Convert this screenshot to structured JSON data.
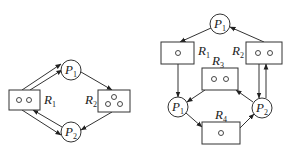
{
  "diagrams": [
    {
      "id": "left",
      "processes": [
        {
          "name": "P",
          "sub": "1",
          "cx": 71,
          "cy": 70
        },
        {
          "name": "P",
          "sub": "2",
          "cx": 71,
          "cy": 132
        }
      ],
      "resources": [
        {
          "name": "R",
          "sub": "1",
          "instances": 2,
          "label_pos": "right"
        },
        {
          "name": "R",
          "sub": "2",
          "instances": 3,
          "label_pos": "left"
        }
      ],
      "edges": [
        {
          "from": "R1",
          "to": "P1",
          "type": "assignment"
        },
        {
          "from": "R1",
          "to": "P1",
          "type": "assignment"
        },
        {
          "from": "P1",
          "to": "R2",
          "type": "request"
        },
        {
          "from": "R2",
          "to": "P2",
          "type": "assignment"
        },
        {
          "from": "P2",
          "to": "R1",
          "type": "request"
        },
        {
          "from": "R1",
          "to": "P2",
          "type": "assignment"
        }
      ]
    },
    {
      "id": "right",
      "processes": [
        {
          "name": "P",
          "sub": "1",
          "position": "top"
        },
        {
          "name": "P",
          "sub": "1",
          "position": "left"
        },
        {
          "name": "P",
          "sub": "2",
          "position": "right"
        }
      ],
      "resources": [
        {
          "name": "R",
          "sub": "1",
          "instances": 1
        },
        {
          "name": "R",
          "sub": "2",
          "instances": 2
        },
        {
          "name": "R",
          "sub": "3",
          "instances": 2
        },
        {
          "name": "R",
          "sub": "4",
          "instances": 1
        }
      ],
      "edges": [
        {
          "from": "P1-top",
          "to": "R1",
          "type": "request"
        },
        {
          "from": "R2",
          "to": "P1-top",
          "type": "assignment"
        },
        {
          "from": "R1",
          "to": "P1-left",
          "type": "assignment"
        },
        {
          "from": "R3",
          "to": "P1-left",
          "type": "assignment"
        },
        {
          "from": "P2",
          "to": "R3",
          "type": "request"
        },
        {
          "from": "R2",
          "to": "P2",
          "type": "assignment"
        },
        {
          "from": "P2",
          "to": "R2",
          "type": "request"
        },
        {
          "from": "P1-left",
          "to": "R4",
          "type": "request"
        },
        {
          "from": "R4",
          "to": "P2",
          "type": "assignment"
        }
      ]
    }
  ],
  "labels": {
    "left_p1": "P",
    "left_p1_sub": "1",
    "left_p2": "P",
    "left_p2_sub": "2",
    "left_r1": "R",
    "left_r1_sub": "1",
    "left_r2": "R",
    "left_r2_sub": "2",
    "right_p1_top": "P",
    "right_p1_top_sub": "1",
    "right_p1_left": "P",
    "right_p1_left_sub": "1",
    "right_p2": "P",
    "right_p2_sub": "2",
    "right_r1": "R",
    "right_r1_sub": "1",
    "right_r2": "R",
    "right_r2_sub": "2",
    "right_r3": "R",
    "right_r3_sub": "3",
    "right_r4": "R",
    "right_r4_sub": "4"
  }
}
